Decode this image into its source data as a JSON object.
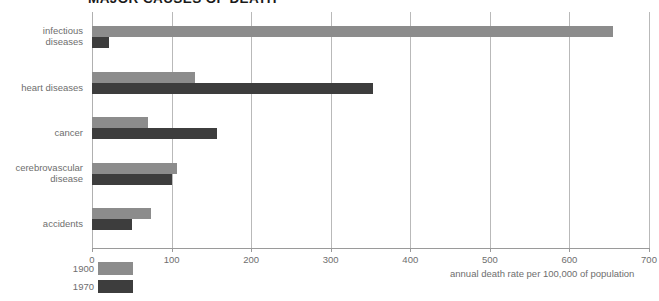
{
  "chart_data": {
    "type": "bar",
    "orientation": "horizontal",
    "title": "MAJOR CAUSES OF DEATH",
    "xlabel": "annual death rate per 100,000 of population",
    "ylabel": "",
    "xlim": [
      0,
      700
    ],
    "xticks": [
      0,
      100,
      200,
      300,
      400,
      500,
      600,
      700
    ],
    "xtick_labels": [
      "0",
      "100",
      "200",
      "300",
      "400",
      "500",
      "600",
      "700"
    ],
    "grid": true,
    "grid_axis": "x",
    "legend_position": "bottom-left",
    "categories": [
      "infectious\ndiseases",
      "heart diseases",
      "cancer",
      "cerebrovascular\ndisease",
      "accidents"
    ],
    "series": [
      {
        "name": "1900",
        "color": "#8c8c8c",
        "values": [
          655,
          130,
          70,
          107,
          74
        ]
      },
      {
        "name": "1970",
        "color": "#3d3d3d",
        "values": [
          21,
          353,
          157,
          101,
          50
        ]
      }
    ]
  },
  "colors": {
    "series_1900": "#8c8c8c",
    "series_1970": "#3d3d3d",
    "gridline": "#b9b9b9",
    "axis": "#9a9a9a",
    "text": "#6e6e6e",
    "title_text": "#1a1a1a",
    "background": "#ffffff"
  },
  "legend": {
    "items": [
      {
        "label": "1900",
        "color": "#8c8c8c"
      },
      {
        "label": "1970",
        "color": "#3d3d3d"
      }
    ]
  },
  "caption": {
    "text": "annual death rate per 100,000 of population"
  }
}
